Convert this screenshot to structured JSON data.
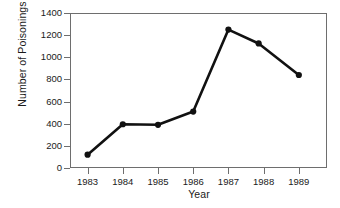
{
  "chart_data": {
    "type": "line",
    "title": "",
    "xlabel": "Year",
    "ylabel": "Number of Poisonings",
    "categories": [
      "1983",
      "1984",
      "1985",
      "1986",
      "1987",
      "1988",
      "1989"
    ],
    "x": [
      1983,
      1984,
      1985,
      1986,
      1987,
      1988,
      1989
    ],
    "values": [
      120,
      395,
      390,
      510,
      1250,
      1125,
      840
    ],
    "series": [
      {
        "name": "Number of Poisonings",
        "values": [
          120,
          395,
          390,
          510,
          1250,
          1125,
          840
        ]
      }
    ],
    "ylim": [
      0,
      1400
    ],
    "yticks": [
      0,
      200,
      400,
      600,
      800,
      1000,
      1200,
      1400
    ],
    "ytick_labels": [
      "0",
      "200",
      "400",
      "600",
      "800",
      "1000",
      "1200",
      "1400"
    ],
    "xlim": [
      1982.5,
      1989.8
    ],
    "xticks": [
      1983,
      1984,
      1985,
      1986,
      1987,
      1988,
      1989
    ],
    "grid": false,
    "legend": false,
    "legend_position": "none",
    "marker": "filled-circle",
    "line_color": "#111111",
    "marker_color": "#111111",
    "axis_color": "#6e6e6e",
    "background_color": "#ffffff",
    "annotations": []
  }
}
